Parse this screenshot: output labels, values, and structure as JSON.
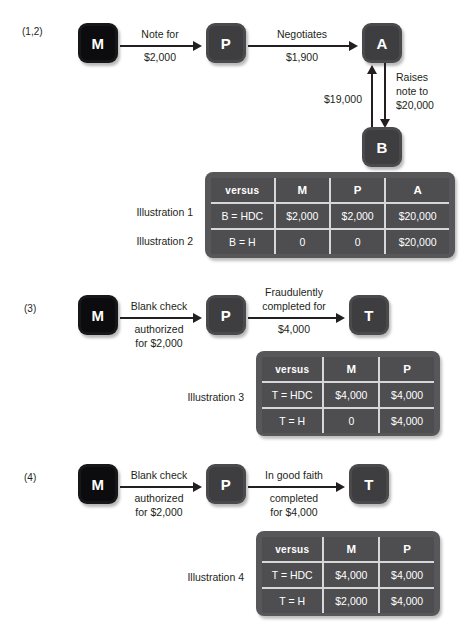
{
  "sections": [
    {
      "id": "section-1-2",
      "label": "(1,2)",
      "nodes": [
        {
          "name": "node-m",
          "letter": "M",
          "shade": "dark"
        },
        {
          "name": "node-p",
          "letter": "P",
          "shade": "mid"
        },
        {
          "name": "node-a",
          "letter": "A",
          "shade": "mid"
        },
        {
          "name": "node-b",
          "letter": "B",
          "shade": "mid"
        }
      ],
      "edges": [
        {
          "name": "edge-m-to-p",
          "above": "Note for",
          "below": "$2,000"
        },
        {
          "name": "edge-p-to-a",
          "above": "Negotiates",
          "below": "$1,900"
        },
        {
          "name": "edge-b-to-a",
          "label": "$19,000"
        },
        {
          "name": "edge-a-to-b",
          "label": "Raises\nnote to\n$20,000"
        }
      ],
      "row_labels": [
        "Illustration 1",
        "Illustration 2"
      ],
      "table": {
        "name": "illustration-table-1",
        "headers": [
          "versus",
          "M",
          "P",
          "A"
        ],
        "rows": [
          [
            "B = HDC",
            "$2,000",
            "$2,000",
            "$20,000"
          ],
          [
            "B = H",
            "0",
            "0",
            "$20,000"
          ]
        ]
      }
    },
    {
      "id": "section-3",
      "label": "(3)",
      "nodes": [
        {
          "name": "node-m",
          "letter": "M",
          "shade": "dark"
        },
        {
          "name": "node-p",
          "letter": "P",
          "shade": "mid"
        },
        {
          "name": "node-t",
          "letter": "T",
          "shade": "mid"
        }
      ],
      "edges": [
        {
          "name": "edge-m-to-p",
          "above": "Blank check",
          "below": "authorized\nfor $2,000"
        },
        {
          "name": "edge-p-to-t",
          "above": "Fraudulently\ncompleted for",
          "below": "$4,000"
        }
      ],
      "row_labels": [
        "Illustration 3"
      ],
      "table": {
        "name": "illustration-table-3",
        "headers": [
          "versus",
          "M",
          "P"
        ],
        "rows": [
          [
            "T = HDC",
            "$4,000",
            "$4,000"
          ],
          [
            "T = H",
            "0",
            "$4,000"
          ]
        ]
      }
    },
    {
      "id": "section-4",
      "label": "(4)",
      "nodes": [
        {
          "name": "node-m",
          "letter": "M",
          "shade": "dark"
        },
        {
          "name": "node-p",
          "letter": "P",
          "shade": "mid"
        },
        {
          "name": "node-t",
          "letter": "T",
          "shade": "mid"
        }
      ],
      "edges": [
        {
          "name": "edge-m-to-p",
          "above": "Blank check",
          "below": "authorized\nfor $2,000"
        },
        {
          "name": "edge-p-to-t",
          "above": "In good faith",
          "below": "completed\nfor $4,000"
        }
      ],
      "row_labels": [
        "Illustration 4"
      ],
      "table": {
        "name": "illustration-table-4",
        "headers": [
          "versus",
          "M",
          "P"
        ],
        "rows": [
          [
            "T = HDC",
            "$4,000",
            "$4,000"
          ],
          [
            "T = H",
            "$2,000",
            "$4,000"
          ]
        ]
      }
    }
  ],
  "colors": {
    "node_dark": "#17171a",
    "node_mid": "#4a4a4d",
    "table_bg": "#57575a",
    "table_cell": "#4e4e51",
    "grid_line": "#d7d7d9",
    "text": "#231f20",
    "page_bg": "#ffffff"
  }
}
